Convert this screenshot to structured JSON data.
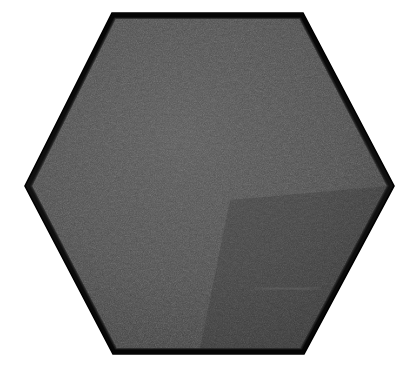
{
  "canvas": {
    "width": 419,
    "height": 371,
    "background_color": "#ffffff"
  },
  "scene": {
    "kind": "product-photo",
    "subject_name": "hexagonal-felt-panel",
    "subject_description": "Flat-top hexagonal dark charcoal grey felt acoustic panel / coaster photographed straight on against a plain white background",
    "caption": "",
    "text_visible": "none"
  },
  "object": {
    "shape": "hexagon",
    "orientation": "flat-top",
    "vertices": [
      [
        112,
        13
      ],
      [
        303,
        13
      ],
      [
        394,
        186
      ],
      [
        304,
        354
      ],
      [
        113,
        354
      ],
      [
        25,
        186
      ]
    ],
    "bounds": {
      "left": 25,
      "top": 13,
      "right": 394,
      "bottom": 354,
      "width": 369,
      "height": 341
    },
    "center": [
      209.5,
      183.5
    ],
    "material": "pressed wool felt",
    "surface_texture": "fine mottled fibrous speckle"
  },
  "colors": {
    "background": "#ffffff",
    "face_base": "#4a4a4a",
    "face_light": "#5e5e5e",
    "face_dark": "#3a3a3a",
    "face_shadow_corner": "#2e2e2e",
    "rim_edge": "#0b0b0b",
    "rim_edge_soft": "#1a1a1a",
    "highlight_streak": "#6a6a6a"
  },
  "edges": {
    "rim_thickness_px": 5,
    "rim_thickness_diagonal_px": 3,
    "rim_style": "dark extruded side wall, heaviest along top and bottom horizontal edges"
  },
  "highlights": [
    {
      "name": "lower-right-sheen",
      "x": 255,
      "y": 287,
      "width": 66,
      "height": 3,
      "opacity": 0.22
    }
  ],
  "lighting": {
    "direction": "diffuse, slightly from upper-left",
    "vignette": "subtle darkening toward lower-right corner"
  }
}
